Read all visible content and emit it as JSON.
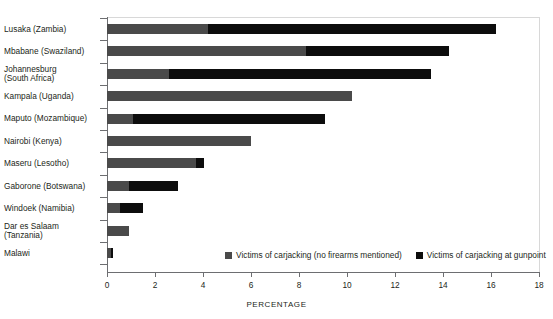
{
  "chart_data": {
    "type": "bar",
    "orientation": "horizontal",
    "stacked": true,
    "title": "",
    "xlabel": "PERCENTAGE",
    "ylabel": "",
    "xlim": [
      0,
      18
    ],
    "xticks": [
      0,
      2,
      4,
      6,
      8,
      10,
      12,
      14,
      16,
      18
    ],
    "grid": false,
    "legend_position": "bottom-right-inside",
    "categories": [
      "Lusaka (Zambia)",
      "Mbabane (Swaziland)",
      "Johannesburg\n(South Africa)",
      "Kampala (Uganda)",
      "Maputo (Mozambique)",
      "Nairobi (Kenya)",
      "Maseru (Lesotho)",
      "Gaborone (Botswana)",
      "Windoek (Namibia)",
      "Dar es Salaam\n(Tanzania)",
      "Malawi"
    ],
    "series": [
      {
        "name": "Victims of carjacking (no firearms mentioned)",
        "color": "#4a4a4a",
        "values": [
          4.2,
          8.3,
          2.6,
          10.2,
          1.1,
          6.0,
          3.7,
          0.9,
          0.55,
          0.9,
          0.15
        ]
      },
      {
        "name": "Victims of carjacking at gunpoint",
        "color": "#0d0d0d",
        "values": [
          12.0,
          5.95,
          10.9,
          0,
          8.0,
          0,
          0.35,
          2.05,
          0.95,
          0,
          0.1
        ]
      }
    ],
    "totals": [
      16.2,
      14.25,
      13.5,
      10.2,
      9.1,
      6.0,
      4.05,
      2.95,
      1.5,
      0.9,
      0.25
    ]
  },
  "axis": {
    "x_title": "PERCENTAGE",
    "tick_labels": [
      "0",
      "2",
      "4",
      "6",
      "8",
      "10",
      "12",
      "14",
      "16",
      "18"
    ]
  },
  "legend": {
    "items": [
      {
        "label": "Victims of carjacking (no firearms mentioned)",
        "color": "#4a4a4a"
      },
      {
        "label": "Victims of carjacking at gunpoint",
        "color": "#0d0d0d"
      }
    ]
  },
  "labels": {
    "rows": [
      "Lusaka (Zambia)",
      "Mbabane (Swaziland)",
      "Johannesburg\n(South Africa)",
      "Kampala (Uganda)",
      "Maputo (Mozambique)",
      "Nairobi (Kenya)",
      "Maseru (Lesotho)",
      "Gaborone (Botswana)",
      "Windoek (Namibia)",
      "Dar es Salaam\n(Tanzania)",
      "Malawi"
    ]
  },
  "title_sliver": ""
}
